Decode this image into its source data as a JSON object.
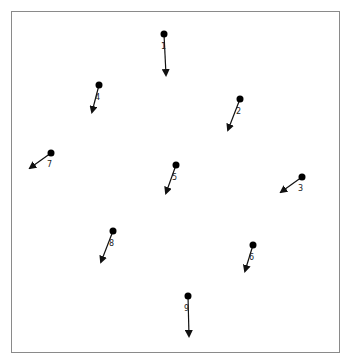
{
  "diagram": {
    "type": "vector-field",
    "frame": {
      "x": 11,
      "y": 11,
      "width": 330,
      "height": 343,
      "border_color": "#8a8a8a"
    },
    "colors": {
      "point": "#000000",
      "arrow": "#111111",
      "label": "#222222"
    },
    "points": [
      {
        "id": "1",
        "label": "1",
        "x": 164,
        "y": 34,
        "to_x": 166,
        "to_y": 75,
        "label_x": 161,
        "label_y": 49
      },
      {
        "id": "2",
        "label": "2",
        "x": 240,
        "y": 99,
        "to_x": 228,
        "to_y": 130,
        "label_x": 236,
        "label_y": 114
      },
      {
        "id": "3",
        "label": "3",
        "x": 302,
        "y": 177,
        "to_x": 281,
        "to_y": 192,
        "label_x": 298,
        "label_y": 191
      },
      {
        "id": "4",
        "label": "4",
        "x": 99,
        "y": 85,
        "to_x": 92,
        "to_y": 112,
        "label_x": 95,
        "label_y": 100
      },
      {
        "id": "5",
        "label": "5",
        "x": 176,
        "y": 165,
        "to_x": 166,
        "to_y": 193,
        "label_x": 172,
        "label_y": 180
      },
      {
        "id": "6",
        "label": "6",
        "x": 253,
        "y": 245,
        "to_x": 245,
        "to_y": 271,
        "label_x": 249,
        "label_y": 260
      },
      {
        "id": "7",
        "label": "7",
        "x": 51,
        "y": 153,
        "to_x": 30,
        "to_y": 168,
        "label_x": 47,
        "label_y": 167
      },
      {
        "id": "8",
        "label": "8",
        "x": 113,
        "y": 231,
        "to_x": 101,
        "to_y": 262,
        "label_x": 109,
        "label_y": 246
      },
      {
        "id": "9",
        "label": "9",
        "x": 188,
        "y": 296,
        "to_x": 189,
        "to_y": 336,
        "label_x": 184,
        "label_y": 311
      }
    ]
  }
}
